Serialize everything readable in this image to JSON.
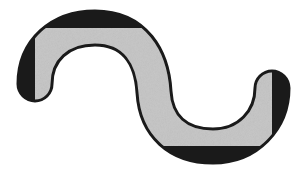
{
  "figure": {
    "shape": "s-curve",
    "fill_color": "#c4c4c4",
    "outline_color": "#1a1a1a",
    "background_color": "#ffffff"
  }
}
